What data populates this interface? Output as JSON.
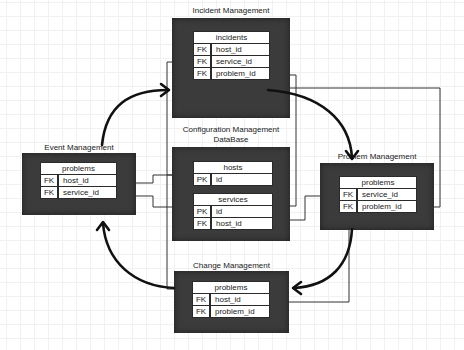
{
  "diagram": {
    "colors": {
      "module_fill": "#3b3b3b",
      "entity_fill": "#ffffff",
      "connector": "#333333",
      "flow_arrow": "#111111",
      "grid": "#f1f1f1"
    },
    "modules": [
      {
        "id": "incident",
        "title": "Incident Management",
        "entities": [
          {
            "name": "incidents",
            "rows": [
              {
                "key": "FK",
                "field": "host_id"
              },
              {
                "key": "FK",
                "field": "service_id"
              },
              {
                "key": "FK",
                "field": "problem_id"
              }
            ]
          }
        ]
      },
      {
        "id": "cmdb",
        "title_line1": "Configuration Management",
        "title_line2": "DataBase",
        "entities": [
          {
            "name": "hosts",
            "rows": [
              {
                "key": "PK",
                "field": "id"
              }
            ]
          },
          {
            "name": "services",
            "rows": [
              {
                "key": "PK",
                "field": "id"
              },
              {
                "key": "FK",
                "field": "host_id"
              }
            ]
          }
        ]
      },
      {
        "id": "event",
        "title": "Event Management",
        "entities": [
          {
            "name": "problems",
            "rows": [
              {
                "key": "FK",
                "field": "host_id"
              },
              {
                "key": "FK",
                "field": "service_id"
              }
            ]
          }
        ]
      },
      {
        "id": "problem",
        "title": "Problem Management",
        "entities": [
          {
            "name": "problems",
            "rows": [
              {
                "key": "FK",
                "field": "service_id"
              },
              {
                "key": "FK",
                "field": "problem_id"
              }
            ]
          }
        ]
      },
      {
        "id": "change",
        "title": "Change Management",
        "entities": [
          {
            "name": "problems",
            "rows": [
              {
                "key": "FK",
                "field": "host_id"
              },
              {
                "key": "FK",
                "field": "problem_id"
              }
            ]
          }
        ]
      }
    ],
    "flows": [
      {
        "from": "Event Management",
        "to": "Incident Management"
      },
      {
        "from": "Incident Management",
        "to": "Problem Management"
      },
      {
        "from": "Problem Management",
        "to": "Change Management"
      },
      {
        "from": "Change Management",
        "to": "Event Management"
      }
    ]
  }
}
